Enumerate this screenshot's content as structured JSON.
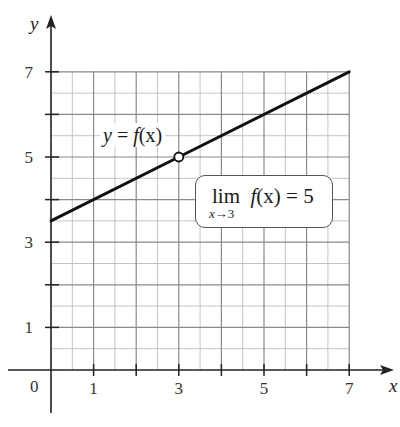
{
  "chart_data": {
    "type": "line",
    "title": "",
    "xlabel": "x",
    "ylabel": "y",
    "xlim": [
      0,
      7
    ],
    "ylim": [
      0,
      7
    ],
    "grid": true,
    "grid_major_step": 1,
    "grid_minor_step": 0.5,
    "x_ticks": [
      1,
      2,
      3,
      4,
      5,
      6,
      7
    ],
    "x_tick_labels": [
      "1",
      "",
      "3",
      "",
      "5",
      "",
      "7"
    ],
    "y_ticks": [
      1,
      2,
      3,
      4,
      5,
      6,
      7
    ],
    "y_tick_labels": [
      "1",
      "",
      "3",
      "",
      "5",
      "",
      "7"
    ],
    "origin_label": "0",
    "series": [
      {
        "name": "y = f(x)",
        "x": [
          0,
          3,
          7
        ],
        "y": [
          3.5,
          5,
          7
        ],
        "equation": "y = 0.5x + 3.5",
        "open_points": [
          [
            3,
            5
          ]
        ],
        "color": "#111111"
      }
    ],
    "annotations": [
      {
        "text": "y = f(x)",
        "x": 1.2,
        "y": 5.5
      },
      {
        "text": "lim x→3 f(x) = 5",
        "x": 5,
        "y": 4.5,
        "boxed": true
      }
    ]
  },
  "labels": {
    "x_axis": "x",
    "y_axis": "y",
    "origin": "0",
    "curve_y": "y",
    "curve_eq": " = ",
    "curve_f": "f",
    "curve_arg": "(x)",
    "lim_word": "lim",
    "lim_f": "f",
    "lim_arg": "(x)",
    "lim_eq": " = 5",
    "lim_sub_x": "x",
    "lim_sub_arrow": "→3"
  },
  "colors": {
    "axis": "#222222",
    "grid_major": "#8a8a8a",
    "grid_minor": "#c4c4c4",
    "curve": "#111111"
  }
}
